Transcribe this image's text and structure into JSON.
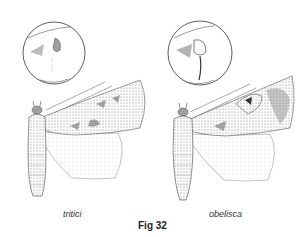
{
  "figure": {
    "title": "Fig 32",
    "panels": [
      {
        "species_label": "tritici"
      },
      {
        "species_label": "obelisca"
      }
    ]
  }
}
